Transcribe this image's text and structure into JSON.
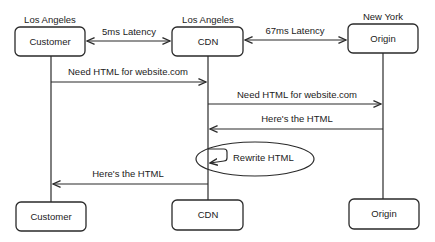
{
  "diagram": {
    "type": "sequence",
    "participants": [
      {
        "id": "customer",
        "label": "Customer",
        "location": "Los Angeles"
      },
      {
        "id": "cdn",
        "label": "CDN",
        "location": "Los Angeles"
      },
      {
        "id": "origin",
        "label": "Origin",
        "location": "New York"
      }
    ],
    "links": [
      {
        "from": "customer",
        "to": "cdn",
        "label": "5ms Latency",
        "bidirectional": true
      },
      {
        "from": "cdn",
        "to": "origin",
        "label": "67ms Latency",
        "bidirectional": true
      }
    ],
    "messages": [
      {
        "from": "customer",
        "to": "cdn",
        "label": "Need HTML for website.com"
      },
      {
        "from": "cdn",
        "to": "origin",
        "label": "Need HTML for website.com"
      },
      {
        "from": "origin",
        "to": "cdn",
        "label": "Here's the HTML"
      },
      {
        "from": "cdn",
        "to": "cdn",
        "label": "Rewrite HTML",
        "self": true,
        "highlighted": true
      },
      {
        "from": "cdn",
        "to": "customer",
        "label": "Here's the HTML"
      }
    ],
    "colors": {
      "stroke": "#2a2a2a",
      "text": "#222222",
      "background": "#ffffff"
    }
  }
}
